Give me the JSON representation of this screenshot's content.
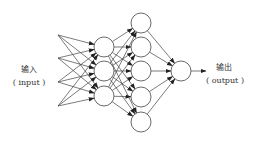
{
  "diagram": {
    "type": "neural-network",
    "input_label": {
      "zh": "输入",
      "en": "( input )"
    },
    "output_label": {
      "zh": "输出",
      "en": "( output )"
    },
    "layers": {
      "input_points": 4,
      "hidden1_nodes": 3,
      "hidden2_nodes": 5,
      "output_nodes": 1
    },
    "colors": {
      "stroke": "#333333",
      "fill": "#ffffff",
      "text": "#333333"
    }
  }
}
